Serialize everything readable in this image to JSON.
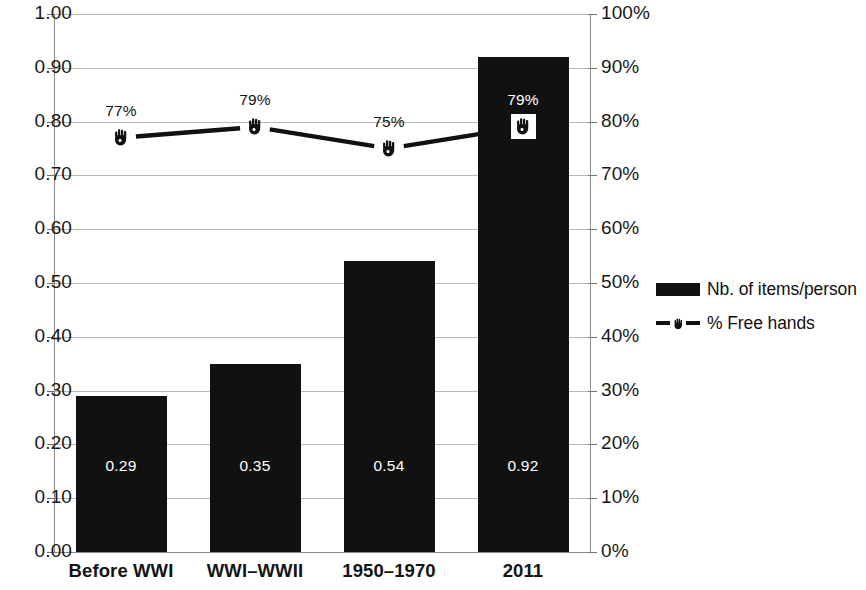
{
  "chart_data": {
    "type": "bar",
    "title": "",
    "xlabel": "",
    "ylabel": "",
    "categories": [
      "Before WWI",
      "WWI–WWII",
      "1950–1970",
      "2011"
    ],
    "series": [
      {
        "name": "Nb. of items/person",
        "type": "bar",
        "axis": "left",
        "values": [
          0.29,
          0.35,
          0.54,
          0.92
        ],
        "value_labels": [
          "0.29",
          "0.35",
          "0.54",
          "0.92"
        ],
        "color": "#111111"
      },
      {
        "name": "% Free hands",
        "type": "line",
        "axis": "right",
        "values": [
          77,
          79,
          75,
          79
        ],
        "value_labels": [
          "77%",
          "79%",
          "75%",
          "79%"
        ],
        "color": "#111111",
        "marker": "hand-icon"
      }
    ],
    "left_axis": {
      "min": 0.0,
      "max": 1.0,
      "step": 0.1,
      "tick_labels": [
        "0.00",
        "0.10",
        "0.20",
        "0.30",
        "0.40",
        "0.50",
        "0.60",
        "0.70",
        "0.80",
        "0.90",
        "1.00"
      ]
    },
    "right_axis": {
      "min": 0,
      "max": 100,
      "step": 10,
      "tick_labels": [
        "0%",
        "10%",
        "20%",
        "30%",
        "40%",
        "50%",
        "60%",
        "70%",
        "80%",
        "90%",
        "100%"
      ]
    },
    "grid": true,
    "legend_position": "right"
  },
  "legend": {
    "items": [
      {
        "label": "Nb. of items/person",
        "marker": "bar-swatch"
      },
      {
        "label": "% Free hands",
        "marker": "dashed-line-hand-icon"
      }
    ]
  }
}
